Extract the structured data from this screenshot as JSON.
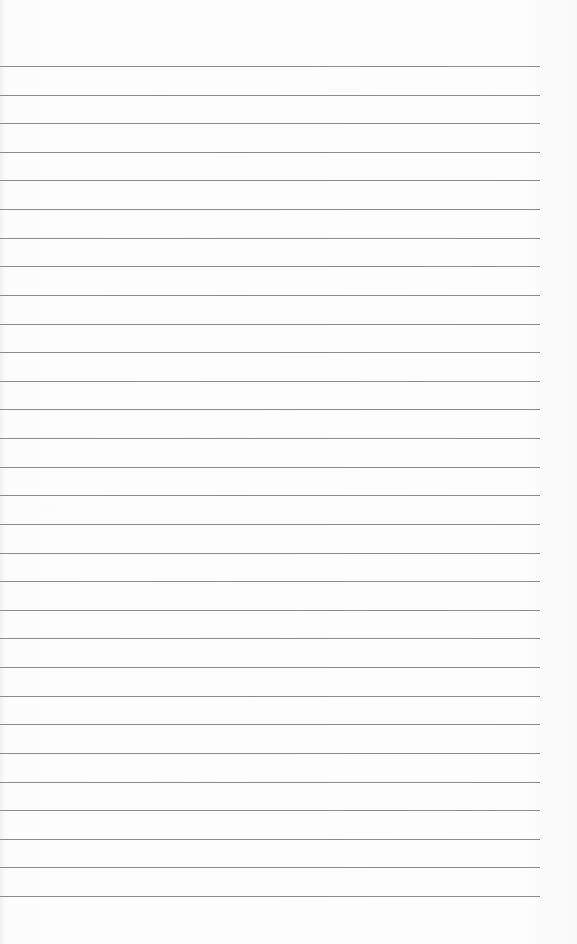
{
  "sheet": {
    "type": "lined-paper",
    "line_count": 30,
    "first_line_y": 66,
    "line_spacing": 28.62,
    "line_width": 540,
    "line_color": "#8c8c8c",
    "background_color": "#fbfbfb"
  }
}
